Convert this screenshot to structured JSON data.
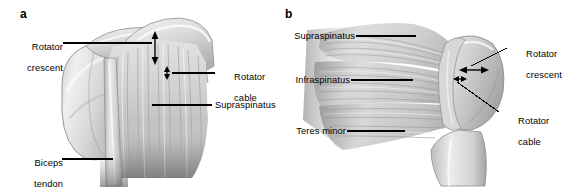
{
  "figure": {
    "background_color": "#ffffff",
    "line_color": "#000000",
    "width": 569,
    "height": 187
  },
  "panels": [
    {
      "letter": "a",
      "view": "superior / anterosuperior view of right shoulder",
      "labels": [
        {
          "id": "rotator-crescent",
          "line1": "Rotator",
          "line2": "crescent"
        },
        {
          "id": "rotator-cable",
          "line1": "Rotator",
          "line2": "cable"
        },
        {
          "id": "supraspinatus",
          "line1": "Supraspinatus",
          "line2": ""
        },
        {
          "id": "biceps-tendon",
          "line1": "Biceps",
          "line2": "tendon"
        }
      ],
      "measure_arrows": [
        {
          "id": "crescent-width-arrow",
          "orientation": "vertical",
          "meaning": "rotator crescent width"
        },
        {
          "id": "cable-width-arrow",
          "orientation": "vertical",
          "meaning": "rotator cable width"
        }
      ]
    },
    {
      "letter": "b",
      "view": "posterior view of right shoulder",
      "labels": [
        {
          "id": "supraspinatus",
          "line1": "Supraspinatus",
          "line2": ""
        },
        {
          "id": "infraspinatus",
          "line1": "Infraspinatus",
          "line2": ""
        },
        {
          "id": "teres-minor",
          "line1": "Teres minor",
          "line2": ""
        },
        {
          "id": "rotator-crescent",
          "line1": "Rotator",
          "line2": "crescent"
        },
        {
          "id": "rotator-cable",
          "line1": "Rotator",
          "line2": "cable"
        }
      ],
      "measure_arrows": [
        {
          "id": "crescent-width-arrow",
          "orientation": "horizontal",
          "meaning": "rotator crescent width"
        },
        {
          "id": "cable-width-arrow",
          "orientation": "horizontal",
          "meaning": "rotator cable width"
        }
      ]
    }
  ]
}
